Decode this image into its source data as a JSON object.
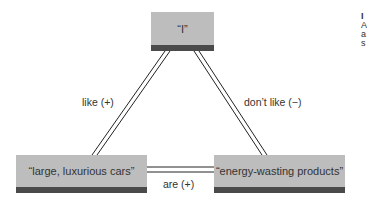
{
  "diagram": {
    "type": "balance-theory-triangle",
    "nodes": {
      "self": {
        "label": "“I”"
      },
      "cars": {
        "label": "“large, luxurious cars”"
      },
      "products": {
        "label": "“energy-wasting products”"
      }
    },
    "edges": {
      "self_to_cars": {
        "label": "like (+)",
        "sign": "+"
      },
      "self_to_products": {
        "label": "don’t like (−)",
        "sign": "−"
      },
      "cars_to_products": {
        "label": "are (+)",
        "sign": "+"
      }
    },
    "colors": {
      "box_fill": "#bdbdbd",
      "box_stripe": "#4a4a4a",
      "line": "#222222"
    }
  },
  "cropped_side_text": {
    "lines": [
      "I",
      "A",
      "a",
      "s"
    ]
  }
}
